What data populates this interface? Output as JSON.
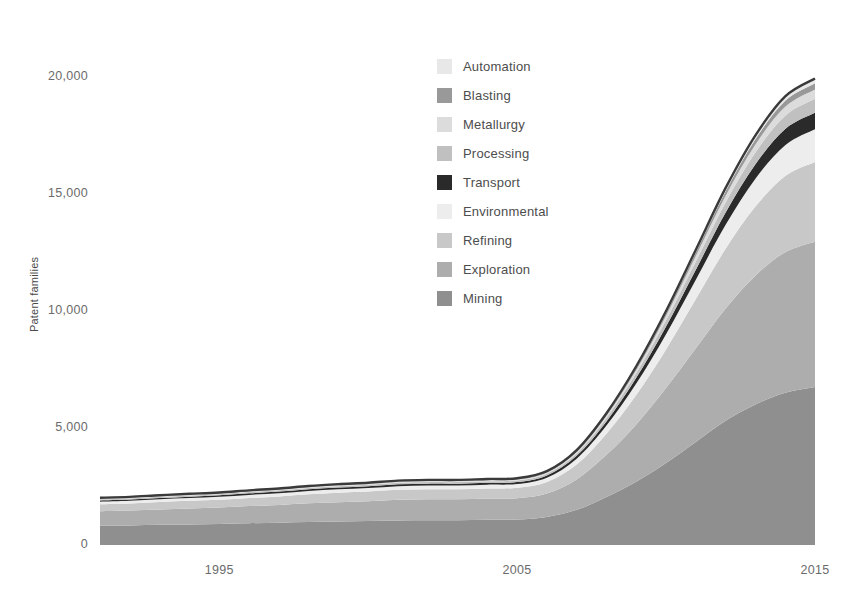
{
  "chart_data": {
    "type": "area",
    "stacked": true,
    "title": "",
    "xlabel": "",
    "ylabel": "Patent families",
    "xlim": [
      1991,
      2015
    ],
    "ylim": [
      0,
      22500
    ],
    "xticks": [
      1995,
      2005,
      2015
    ],
    "xtick_labels": [
      "1995",
      "2005",
      "2015"
    ],
    "yticks": [
      0,
      5000,
      10000,
      15000,
      20000
    ],
    "ytick_labels": [
      "0",
      "5,000",
      "10,000",
      "15,000",
      "20,000"
    ],
    "grid": false,
    "legend_position": "upper center",
    "x": [
      1991,
      1992,
      1993,
      1994,
      1995,
      1996,
      1997,
      1998,
      1999,
      2000,
      2001,
      2002,
      2003,
      2004,
      2005,
      2006,
      2007,
      2008,
      2009,
      2010,
      2011,
      2012,
      2013,
      2014,
      2015
    ],
    "stack_order_bottom_to_top": [
      "Mining",
      "Exploration",
      "Refining",
      "Environmental",
      "Transport",
      "Processing",
      "Metallurgy",
      "Blasting",
      "Automation"
    ],
    "series": [
      {
        "name": "Mining",
        "color": "#8f8f8f",
        "values": [
          820,
          830,
          860,
          880,
          900,
          930,
          950,
          980,
          1000,
          1020,
          1050,
          1060,
          1060,
          1080,
          1090,
          1200,
          1500,
          2050,
          2700,
          3500,
          4400,
          5300,
          6000,
          6500,
          6750
        ]
      },
      {
        "name": "Exploration",
        "color": "#adadad",
        "values": [
          620,
          640,
          660,
          680,
          700,
          730,
          760,
          800,
          830,
          850,
          880,
          890,
          890,
          900,
          910,
          1000,
          1300,
          1800,
          2450,
          3200,
          4000,
          4800,
          5500,
          6000,
          6200
        ]
      },
      {
        "name": "Refining",
        "color": "#c8c8c8",
        "values": [
          300,
          305,
          315,
          325,
          335,
          350,
          365,
          385,
          400,
          410,
          425,
          430,
          430,
          435,
          440,
          490,
          640,
          900,
          1250,
          1650,
          2100,
          2550,
          2950,
          3250,
          3400
        ]
      },
      {
        "name": "Environmental",
        "color": "#ededed",
        "values": [
          110,
          112,
          116,
          120,
          124,
          130,
          136,
          143,
          149,
          153,
          158,
          160,
          160,
          162,
          164,
          185,
          245,
          350,
          490,
          650,
          830,
          1020,
          1190,
          1320,
          1400
        ]
      },
      {
        "name": "Transport",
        "color": "#2a2a2a",
        "values": [
          55,
          56,
          58,
          60,
          62,
          65,
          68,
          71,
          74,
          76,
          79,
          80,
          80,
          81,
          82,
          93,
          123,
          176,
          247,
          330,
          425,
          525,
          615,
          690,
          700
        ]
      },
      {
        "name": "Processing",
        "color": "#c0c0c0",
        "values": [
          45,
          46,
          47,
          49,
          50,
          53,
          55,
          58,
          60,
          62,
          64,
          65,
          65,
          66,
          67,
          76,
          100,
          144,
          202,
          270,
          348,
          430,
          505,
          570,
          600
        ]
      },
      {
        "name": "Metallurgy",
        "color": "#dcdcdc",
        "values": [
          30,
          31,
          32,
          33,
          34,
          35,
          37,
          39,
          40,
          41,
          43,
          43,
          43,
          44,
          45,
          51,
          67,
          96,
          135,
          180,
          232,
          287,
          337,
          380,
          400
        ]
      },
      {
        "name": "Blasting",
        "color": "#999999",
        "values": [
          20,
          20,
          21,
          22,
          22,
          23,
          24,
          26,
          27,
          27,
          28,
          29,
          29,
          29,
          30,
          34,
          45,
          64,
          90,
          120,
          155,
          191,
          225,
          253,
          265
        ]
      },
      {
        "name": "Automation",
        "color": "#e8e8e8",
        "values": [
          15,
          15,
          16,
          16,
          17,
          18,
          18,
          19,
          20,
          21,
          21,
          22,
          22,
          22,
          23,
          26,
          34,
          48,
          68,
          90,
          116,
          143,
          169,
          190,
          200
        ]
      }
    ],
    "outline": {
      "name": "total-outline",
      "color": "#3a3a3a"
    }
  },
  "legend": {
    "items": [
      {
        "label": "Automation",
        "color": "#e8e8e8"
      },
      {
        "label": "Blasting",
        "color": "#999999"
      },
      {
        "label": "Metallurgy",
        "color": "#dcdcdc"
      },
      {
        "label": "Processing",
        "color": "#c0c0c0"
      },
      {
        "label": "Transport",
        "color": "#2a2a2a"
      },
      {
        "label": "Environmental",
        "color": "#ededed"
      },
      {
        "label": "Refining",
        "color": "#c8c8c8"
      },
      {
        "label": "Exploration",
        "color": "#adadad"
      },
      {
        "label": "Mining",
        "color": "#8f8f8f"
      }
    ]
  }
}
